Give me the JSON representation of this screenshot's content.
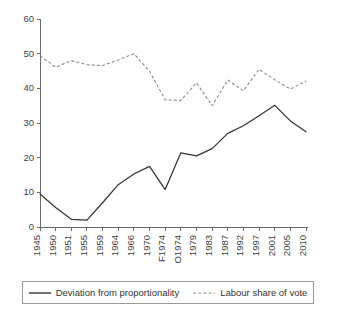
{
  "chart_data": {
    "type": "line",
    "title": "",
    "subtitle": "",
    "xlabel": "",
    "ylabel": "",
    "ylim": [
      0,
      60
    ],
    "yticks": [
      0,
      10,
      20,
      30,
      40,
      50,
      60
    ],
    "grid": false,
    "legend_position": "bottom",
    "categories": [
      "1945",
      "1950",
      "1951",
      "1955",
      "1959",
      "1964",
      "1966",
      "1970",
      "F1974",
      "O1974",
      "1979",
      "1983",
      "1987",
      "1992",
      "1997",
      "2001",
      "2005",
      "2010"
    ],
    "series": [
      {
        "name": "Deviation from proportionality",
        "style": "solid",
        "color": "#333333",
        "values": [
          9.5,
          5.6,
          2.2,
          2.0,
          7.0,
          12.2,
          15.3,
          17.5,
          10.8,
          21.4,
          20.5,
          22.6,
          27.0,
          29.2,
          32.1,
          35.1,
          30.6,
          27.5
        ]
      },
      {
        "name": "Labour share of vote",
        "style": "dashed",
        "color": "#8a8a8a",
        "values": [
          49.4,
          46.1,
          48.0,
          46.8,
          46.6,
          48.2,
          50.0,
          44.9,
          36.7,
          36.5,
          41.6,
          35.0,
          42.4,
          39.3,
          45.5,
          42.5,
          39.8,
          42.1
        ]
      }
    ]
  },
  "legend": {
    "entries": [
      {
        "label": "Deviation from proportionality",
        "style": "solid"
      },
      {
        "label": "Labour share of vote",
        "style": "dashed"
      }
    ]
  }
}
